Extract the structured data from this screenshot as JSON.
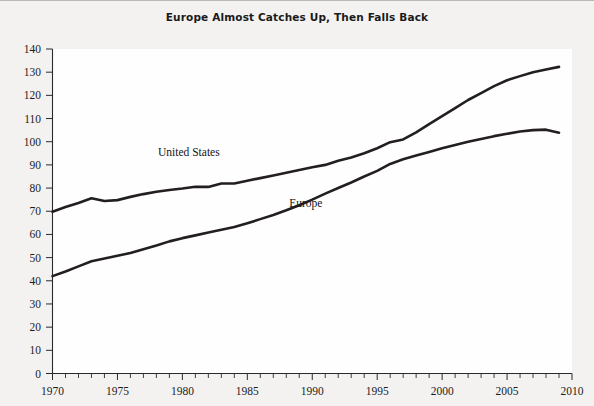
{
  "chart_data": {
    "type": "line",
    "title": "Europe Almost Catches Up, Then Falls Back",
    "xlabel": "",
    "ylabel": "",
    "xlim": [
      1970,
      2010
    ],
    "ylim": [
      0,
      140
    ],
    "ytick_step": 10,
    "yticks": [
      0,
      10,
      20,
      30,
      40,
      50,
      60,
      70,
      80,
      90,
      100,
      110,
      120,
      130,
      140
    ],
    "xticks": [
      1970,
      1975,
      1980,
      1985,
      1990,
      1995,
      2000,
      2005,
      2010
    ],
    "xtick_minor_step": 1,
    "grid": false,
    "legend": "inline-annotations",
    "line_color": "#231f20",
    "background_color": "#f3f2f1",
    "plot_background_color": "#fefefe",
    "x": [
      1970,
      1971,
      1972,
      1973,
      1974,
      1975,
      1976,
      1977,
      1978,
      1979,
      1980,
      1981,
      1982,
      1983,
      1984,
      1985,
      1986,
      1987,
      1988,
      1989,
      1990,
      1991,
      1992,
      1993,
      1994,
      1995,
      1996,
      1997,
      1998,
      1999,
      2000,
      2001,
      2002,
      2003,
      2004,
      2005,
      2006,
      2007,
      2008,
      2009
    ],
    "series": [
      {
        "name": "United States",
        "label_x": 1980.5,
        "label_y": 94,
        "values": [
          69.8,
          71.8,
          73.6,
          75.6,
          74.4,
          74.8,
          76.2,
          77.4,
          78.4,
          79.2,
          79.8,
          80.6,
          80.5,
          82.0,
          82.0,
          83.2,
          84.3,
          85.4,
          86.6,
          87.8,
          89.0,
          90.0,
          91.8,
          93.2,
          95.0,
          97.2,
          99.8,
          101.0,
          104.0,
          107.6,
          111.0,
          114.5,
          118.0,
          121.0,
          124.0,
          126.5,
          128.3,
          130.0,
          131.2,
          132.3
        ]
      },
      {
        "name": "Europe",
        "label_x": 1989.5,
        "label_y": 72,
        "values": [
          42.0,
          44.0,
          46.2,
          48.4,
          49.6,
          50.8,
          52.0,
          53.6,
          55.2,
          57.0,
          58.4,
          59.6,
          60.8,
          62.0,
          63.2,
          64.8,
          66.6,
          68.4,
          70.4,
          72.6,
          75.0,
          77.6,
          80.0,
          82.4,
          85.0,
          87.4,
          90.4,
          92.4,
          94.0,
          95.6,
          97.2,
          98.6,
          100.0,
          101.2,
          102.4,
          103.4,
          104.4,
          105.0,
          105.2,
          103.9
        ]
      }
    ]
  },
  "axes": {
    "y_tick_labels": [
      "140",
      "130",
      "120",
      "110",
      "100",
      "90",
      "80",
      "70",
      "60",
      "50",
      "40",
      "30",
      "20",
      "10",
      "0"
    ],
    "x_tick_labels": [
      "1970",
      "1975",
      "1980",
      "1985",
      "1990",
      "1995",
      "2000",
      "2005",
      "2010"
    ]
  }
}
